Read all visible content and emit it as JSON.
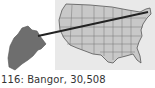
{
  "caption": {
    "rank": "116",
    "city": "Bangor",
    "population": "30,508",
    "text": "116: Bangor, 30,508"
  },
  "map": {
    "highlighted_state": "Maine",
    "state_fill": "#6e6e6e",
    "us_fill": "#c8c8c8",
    "border_color": "#555555",
    "pointer_line_color": "#222222",
    "background": "#e9e9e9"
  }
}
